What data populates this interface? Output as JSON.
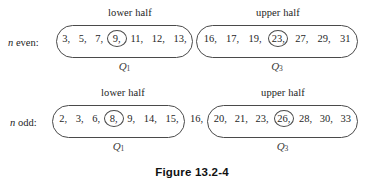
{
  "figure": {
    "caption": "Figure 13.2-4",
    "rows": [
      {
        "id": "n-even",
        "label_prefix": "n",
        "label_suffix": " even:",
        "lower": {
          "header": "lower half",
          "quartile_label": "Q",
          "quartile_sub": "1",
          "values": [
            "3,",
            "5,",
            "7,",
            "9,",
            "11,",
            "12,",
            "13,"
          ],
          "circled_index": 3
        },
        "between": "",
        "upper": {
          "header": "upper half",
          "quartile_label": "Q",
          "quartile_sub": "3",
          "values": [
            "16,",
            "17,",
            "19,",
            "23,",
            "27,",
            "29,",
            "31"
          ],
          "circled_index": 3
        }
      },
      {
        "id": "n-odd",
        "label_prefix": "n",
        "label_suffix": " odd:",
        "lower": {
          "header": "lower half",
          "quartile_label": "Q",
          "quartile_sub": "1",
          "values": [
            "2,",
            "3,",
            "6,",
            "8,",
            "9,",
            "14,",
            "15,"
          ],
          "circled_index": 3
        },
        "between": "16,",
        "upper": {
          "header": "upper half",
          "quartile_label": "Q",
          "quartile_sub": "3",
          "values": [
            "20,",
            "21,",
            "23,",
            "26,",
            "28,",
            "30,",
            "33"
          ],
          "circled_index": 3
        }
      }
    ]
  },
  "colors": {
    "stroke": "#4a4a4a",
    "text": "#1f1f1f",
    "caption": "#111111"
  }
}
